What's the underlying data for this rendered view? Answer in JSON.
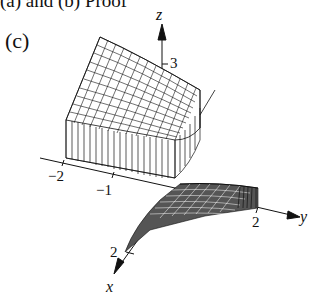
{
  "header": {
    "text": "(a) and (b) Proof"
  },
  "figure": {
    "panel_label": "(c)",
    "axes": {
      "z": {
        "name": "z",
        "tick": "3"
      },
      "y": {
        "name": "y",
        "tick": "2"
      },
      "x": {
        "name": "x",
        "tick": "2"
      },
      "neg_ticks": [
        "−2",
        "−1"
      ]
    },
    "colors": {
      "ink": "#111111",
      "background": "#ffffff"
    }
  }
}
